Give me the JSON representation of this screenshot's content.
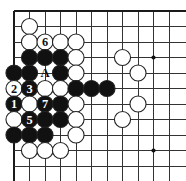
{
  "diagram": {
    "kind": "go-board-diagram",
    "caption": "",
    "board": {
      "cols": 11,
      "rows": 11,
      "origin_x": 14,
      "origin_y": 11,
      "spacing": 15.5,
      "line_color": "#333333",
      "edge_color": "#1a1a1a",
      "background": "#ffffff",
      "star_points": [
        {
          "col": 9,
          "row": 3
        }
      ],
      "edges": {
        "left": true,
        "top": true,
        "right": false,
        "bottom": false
      }
    },
    "colors": {
      "black_stone": "#111111",
      "white_stone": "#ffffff",
      "stone_outline": "#222222",
      "black_label": "#ffffff",
      "white_label": "#111111",
      "marker_label": "#111111",
      "star_point": "#111111"
    },
    "stones": [
      {
        "col": 1,
        "row": 1,
        "color": "white",
        "label": ""
      },
      {
        "col": 1,
        "row": 2,
        "color": "white",
        "label": ""
      },
      {
        "col": 2,
        "row": 2,
        "color": "white",
        "label": "6"
      },
      {
        "col": 3,
        "row": 2,
        "color": "white",
        "label": ""
      },
      {
        "col": 4,
        "row": 2,
        "color": "white",
        "label": ""
      },
      {
        "col": 1,
        "row": 3,
        "color": "black",
        "label": ""
      },
      {
        "col": 2,
        "row": 3,
        "color": "black",
        "label": ""
      },
      {
        "col": 3,
        "row": 3,
        "color": "black",
        "label": ""
      },
      {
        "col": 4,
        "row": 3,
        "color": "white",
        "label": ""
      },
      {
        "col": 7,
        "row": 3,
        "color": "white",
        "label": ""
      },
      {
        "col": 0,
        "row": 4,
        "color": "black",
        "label": ""
      },
      {
        "col": 1,
        "row": 4,
        "color": "black",
        "label": ""
      },
      {
        "col": 3,
        "row": 4,
        "color": "black",
        "label": ""
      },
      {
        "col": 4,
        "row": 4,
        "color": "white",
        "label": ""
      },
      {
        "col": 8,
        "row": 4,
        "color": "white",
        "label": ""
      },
      {
        "col": 0,
        "row": 5,
        "color": "white",
        "label": "2"
      },
      {
        "col": 1,
        "row": 5,
        "color": "black",
        "label": "3"
      },
      {
        "col": 2,
        "row": 5,
        "color": "white",
        "label": ""
      },
      {
        "col": 3,
        "row": 5,
        "color": "white",
        "label": ""
      },
      {
        "col": 4,
        "row": 5,
        "color": "black",
        "label": ""
      },
      {
        "col": 5,
        "row": 5,
        "color": "black",
        "label": ""
      },
      {
        "col": 6,
        "row": 5,
        "color": "black",
        "label": ""
      },
      {
        "col": 0,
        "row": 6,
        "color": "black",
        "label": "1"
      },
      {
        "col": 1,
        "row": 6,
        "color": "white",
        "label": ""
      },
      {
        "col": 2,
        "row": 6,
        "color": "black",
        "label": "7"
      },
      {
        "col": 3,
        "row": 6,
        "color": "black",
        "label": ""
      },
      {
        "col": 4,
        "row": 6,
        "color": "white",
        "label": ""
      },
      {
        "col": 8,
        "row": 6,
        "color": "white",
        "label": ""
      },
      {
        "col": 0,
        "row": 7,
        "color": "white",
        "label": ""
      },
      {
        "col": 1,
        "row": 7,
        "color": "black",
        "label": "5"
      },
      {
        "col": 2,
        "row": 7,
        "color": "black",
        "label": ""
      },
      {
        "col": 3,
        "row": 7,
        "color": "black",
        "label": ""
      },
      {
        "col": 4,
        "row": 7,
        "color": "white",
        "label": ""
      },
      {
        "col": 7,
        "row": 7,
        "color": "white",
        "label": ""
      },
      {
        "col": 0,
        "row": 8,
        "color": "black",
        "label": ""
      },
      {
        "col": 1,
        "row": 8,
        "color": "black",
        "label": ""
      },
      {
        "col": 2,
        "row": 8,
        "color": "black",
        "label": ""
      },
      {
        "col": 4,
        "row": 8,
        "color": "white",
        "label": ""
      },
      {
        "col": 1,
        "row": 9,
        "color": "white",
        "label": ""
      },
      {
        "col": 2,
        "row": 9,
        "color": "white",
        "label": ""
      },
      {
        "col": 3,
        "row": 9,
        "color": "white",
        "label": ""
      }
    ],
    "markers": [
      {
        "col": 2,
        "row": 4,
        "text": "A",
        "kind": "letter-marker"
      }
    ],
    "move_numbers": [
      "1",
      "2",
      "3",
      "5",
      "6",
      "7"
    ],
    "legend": {
      "black_moves": [
        "1",
        "3",
        "5",
        "7"
      ],
      "white_moves": [
        "2",
        "6"
      ],
      "letter_points": [
        "A"
      ]
    }
  }
}
